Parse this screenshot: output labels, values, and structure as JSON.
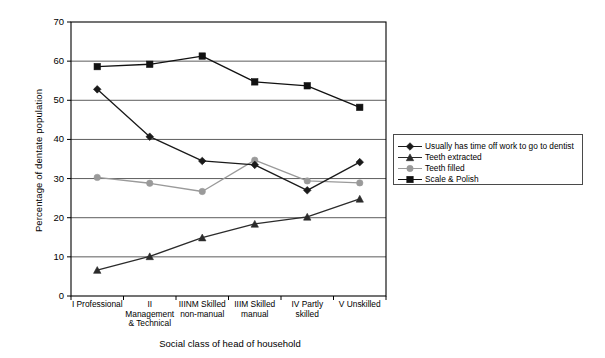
{
  "chart_data": {
    "type": "line",
    "title": "",
    "xlabel": "Social class of head of household",
    "ylabel": "Percentage of dentate population",
    "categories": [
      "I Professional",
      "II\nManagement\n& Technical",
      "IIINM Skilled\nnon-manual",
      "IIIM Skilled\nmanual",
      "IV Partly\nskilled",
      "V Unskilled"
    ],
    "ylim": [
      0,
      70
    ],
    "yticks": [
      0,
      10,
      20,
      30,
      40,
      50,
      60,
      70
    ],
    "ytick_labels": [
      "0",
      "10",
      "20",
      "30",
      "40",
      "50",
      "60",
      "70"
    ],
    "grid": "horizontal",
    "legend_position": "right",
    "series": [
      {
        "name": "Usually has time off work to go to dentist",
        "marker": "diamond",
        "color": "#1a1a1a",
        "values": [
          52.8,
          40.7,
          34.5,
          33.5,
          27.0,
          34.2
        ]
      },
      {
        "name": "Teeth extracted",
        "marker": "triangle",
        "color": "#2b2b2b",
        "values": [
          6.6,
          10.1,
          14.9,
          18.4,
          20.2,
          24.8
        ]
      },
      {
        "name": "Teeth filled",
        "marker": "circle",
        "color": "#9a9a9a",
        "values": [
          30.3,
          28.8,
          26.7,
          34.7,
          29.4,
          28.9
        ]
      },
      {
        "name": "Scale & Polish",
        "marker": "square",
        "color": "#111111",
        "values": [
          58.6,
          59.2,
          61.3,
          54.7,
          53.7,
          48.2
        ]
      }
    ]
  },
  "axes": {
    "y_title": "Percentage of dentate population",
    "x_title": "Social class of head of household"
  },
  "legend": {
    "items": [
      {
        "label": "Usually has time off work to go to dentist",
        "marker": "diamond-marker-icon"
      },
      {
        "label": "Teeth extracted",
        "marker": "triangle-marker-icon"
      },
      {
        "label": "Teeth filled",
        "marker": "circle-marker-icon"
      },
      {
        "label": "Scale & Polish",
        "marker": "square-marker-icon"
      }
    ]
  },
  "colors": {
    "plot_border": "#000000",
    "gridline": "#5c5c5c",
    "background": "#ffffff"
  }
}
